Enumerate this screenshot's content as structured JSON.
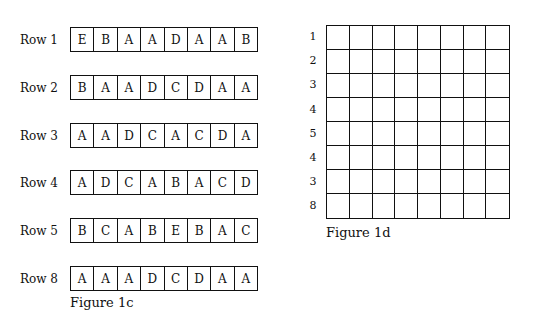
{
  "figure_1c": {
    "caption": "Figure 1c",
    "rows": [
      {
        "label": "Row 1",
        "cells": [
          "E",
          "B",
          "A",
          "A",
          "D",
          "A",
          "A",
          "B"
        ]
      },
      {
        "label": "Row 2",
        "cells": [
          "B",
          "A",
          "A",
          "D",
          "C",
          "D",
          "A",
          "A"
        ]
      },
      {
        "label": "Row 3",
        "cells": [
          "A",
          "A",
          "D",
          "C",
          "A",
          "C",
          "D",
          "A"
        ]
      },
      {
        "label": "Row 4",
        "cells": [
          "A",
          "D",
          "C",
          "A",
          "B",
          "A",
          "C",
          "D"
        ]
      },
      {
        "label": "Row 5",
        "cells": [
          "B",
          "C",
          "A",
          "B",
          "E",
          "B",
          "A",
          "C"
        ]
      },
      {
        "label": "Row 8",
        "cells": [
          "A",
          "A",
          "A",
          "D",
          "C",
          "D",
          "A",
          "A"
        ]
      }
    ]
  },
  "figure_1d": {
    "caption": "Figure 1d",
    "row_labels": [
      "1",
      "2",
      "3",
      "4",
      "5",
      "4",
      "3",
      "8"
    ],
    "columns": 8
  }
}
